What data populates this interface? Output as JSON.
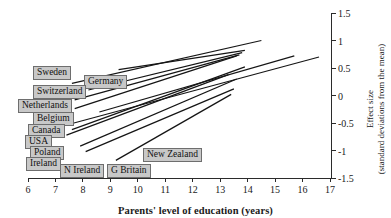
{
  "chart_data": {
    "type": "line",
    "title": "",
    "xlabel": "Parents' level of education (years)",
    "ylabel_line1": "Effect size",
    "ylabel_line2": "(standard deviations from the mean)",
    "xlim": [
      6,
      17
    ],
    "ylim": [
      -1.5,
      1.5
    ],
    "xticks": [
      6,
      7,
      8,
      9,
      10,
      11,
      12,
      13,
      14,
      15,
      16,
      17
    ],
    "xtick_labels": [
      "6",
      "7",
      "8",
      "9",
      "10",
      "11",
      "12",
      "13",
      "14",
      "15",
      "16",
      "17"
    ],
    "yticks": [
      -1.5,
      -1,
      -0.5,
      0,
      0.5,
      1,
      1.5
    ],
    "ytick_labels": [
      "-1.5",
      "-1",
      "-0.5",
      "0",
      "0.5",
      "1",
      "1.5"
    ],
    "grid": false,
    "legend": "inline-labels",
    "y_axis_position": "right",
    "series": [
      {
        "name": "Sweden",
        "x": [
          7.6,
          14.5
        ],
        "y": [
          0.22,
          1.0
        ]
      },
      {
        "name": "Germany",
        "x": [
          9.3,
          13.9
        ],
        "y": [
          0.47,
          0.82
        ]
      },
      {
        "name": "Switzerland",
        "x": [
          8.2,
          13.8
        ],
        "y": [
          0.1,
          0.78
        ]
      },
      {
        "name": "Netherlands",
        "x": [
          7.7,
          13.7
        ],
        "y": [
          -0.08,
          0.74
        ]
      },
      {
        "name": "Belgium",
        "x": [
          7.7,
          13.6
        ],
        "y": [
          -0.24,
          0.72
        ]
      },
      {
        "name": "Canada",
        "x": [
          8.6,
          15.7
        ],
        "y": [
          -0.3,
          0.72
        ]
      },
      {
        "name": "USA",
        "x": [
          7.3,
          16.6
        ],
        "y": [
          -0.55,
          0.7
        ]
      },
      {
        "name": "Poland",
        "x": [
          7.6,
          13.9
        ],
        "y": [
          -0.62,
          0.52
        ]
      },
      {
        "name": "Ireland",
        "x": [
          7.4,
          13.3
        ],
        "y": [
          -0.72,
          0.38
        ]
      },
      {
        "name": "N Ireland",
        "x": [
          7.9,
          13.6
        ],
        "y": [
          -0.92,
          0.3
        ]
      },
      {
        "name": "G Britain",
        "x": [
          8.1,
          13.5
        ],
        "y": [
          -1.02,
          0.12
        ]
      },
      {
        "name": "New Zealand",
        "x": [
          9.2,
          13.4
        ],
        "y": [
          -1.18,
          0.02
        ]
      }
    ]
  },
  "country_labels": [
    {
      "name": "Sweden",
      "left": 33,
      "top": 66
    },
    {
      "name": "Germany",
      "left": 84,
      "top": 75
    },
    {
      "name": "Switzerland",
      "left": 33,
      "top": 85
    },
    {
      "name": "Netherlands",
      "left": 18,
      "top": 99
    },
    {
      "name": "Belgium",
      "left": 33,
      "top": 112
    },
    {
      "name": "Canada",
      "left": 28,
      "top": 124
    },
    {
      "name": "USA",
      "left": 25,
      "top": 135
    },
    {
      "name": "Poland",
      "left": 30,
      "top": 146
    },
    {
      "name": "Ireland",
      "left": 26,
      "top": 157
    },
    {
      "name": "N Ireland",
      "left": 60,
      "top": 164
    },
    {
      "name": "G Britain",
      "left": 107,
      "top": 164
    },
    {
      "name": "New Zealand",
      "left": 143,
      "top": 148
    }
  ],
  "axes": {
    "x_axis_title": "Parents' level of education (years)",
    "y_axis_title_line1": "Effect size",
    "y_axis_title_line2": "(standard deviations from the mean)"
  }
}
